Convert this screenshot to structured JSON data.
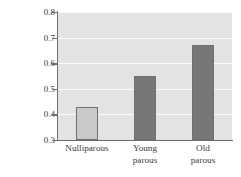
{
  "chart_data": {
    "type": "bar",
    "title": "",
    "xlabel": "",
    "ylabel_line_1": "Mean standardized rank of",
    "ylabel_line_2": "copulation partner (1 = high)",
    "categories": [
      "Nulliparous",
      "Young parous",
      "Old parous"
    ],
    "category_lines": [
      [
        "Nulliparous"
      ],
      [
        "Young",
        "parous"
      ],
      [
        "Old",
        "parous"
      ]
    ],
    "values": [
      0.43,
      0.55,
      0.67
    ],
    "ylim": [
      0.3,
      0.8
    ],
    "yticks": [
      0.3,
      0.4,
      0.5,
      0.6,
      0.7,
      0.8
    ],
    "ytick_labels": [
      "0.3",
      "0.4",
      "0.5",
      "0.6",
      "0.7",
      "0.8"
    ],
    "grid": true,
    "legend": "none",
    "bar_colors": [
      "#c9c9c9",
      "#777777",
      "#777777"
    ],
    "bar_edge_color": "#6f6f6f",
    "plot_background": "#e3e3e3",
    "gridline_color": "#fbfbfb",
    "axis_color": "#6e6e6e",
    "text_color": "#3d3d3d"
  }
}
